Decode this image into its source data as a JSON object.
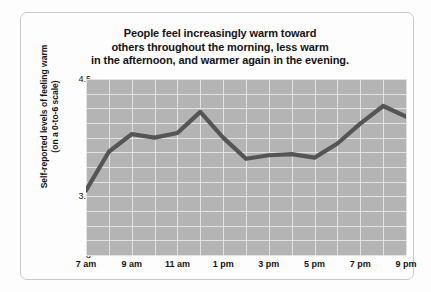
{
  "chart_data": {
    "type": "line",
    "title": "People feel increasingly warm toward others throughout the morning, less warm in the afternoon, and warmer again in the evening.",
    "title_lines": [
      "People feel increasingly warm toward",
      "others throughout the morning, less warm",
      "in the afternoon, and warmer again in the evening."
    ],
    "xlabel": "",
    "ylabel": "Self-reported levels of feeling warm (on a 0-to-6 scale)",
    "ylabel_lines": [
      "Self-reported levels of feeling warm",
      "(on a 0-to-6 scale)"
    ],
    "ylim": [
      3,
      4.5
    ],
    "ytick_labels": [
      "4.5",
      "4",
      "3.5",
      "3"
    ],
    "ytick_values": [
      4.5,
      4,
      3.5,
      3
    ],
    "xtick_labels": [
      "7 am",
      "9 am",
      "11 am",
      "1 pm",
      "3 pm",
      "5 pm",
      "7 pm",
      "9 pm"
    ],
    "xtick_values": [
      7,
      9,
      11,
      13,
      15,
      17,
      19,
      21
    ],
    "x": [
      7,
      8,
      9,
      10,
      11,
      12,
      13,
      14,
      15,
      16,
      17,
      18,
      19,
      20,
      21
    ],
    "values": [
      3.55,
      3.88,
      4.03,
      4.0,
      4.04,
      4.22,
      4.0,
      3.82,
      3.85,
      3.86,
      3.83,
      3.95,
      4.12,
      4.27,
      4.18
    ],
    "grid": true,
    "legend": "none",
    "line_color": "#555555",
    "plot_bg_color": "#b4b4b4",
    "grid_color": "#e2e2e2"
  }
}
